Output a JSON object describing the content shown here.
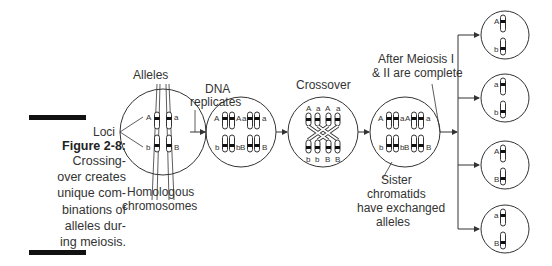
{
  "figure": {
    "title": "Figure 2-8:",
    "caption": "Crossing-\nover creates\nunique com-\nbinations of\nalleles dur-\ning meiosis."
  },
  "labels": {
    "alleles": "Alleles",
    "loci": "Loci",
    "homologous_1": "Homologous",
    "homologous_2": "chromosomes",
    "dna_1": "DNA",
    "dna_2": "replicates",
    "crossover": "Crossover",
    "after_1": "After Meiosis I",
    "after_2": "& II are complete",
    "sister_1": "Sister",
    "sister_2": "chromatids",
    "sister_3": "have exchanged",
    "sister_4": "alleles"
  },
  "stages": [
    {
      "name": "homologous-pair",
      "top_alleles": [
        "A",
        "a"
      ],
      "bottom_alleles": [
        "b",
        "B"
      ]
    },
    {
      "name": "replicated",
      "top_alleles": [
        "A",
        "A",
        "a",
        "a"
      ],
      "bottom_alleles": [
        "b",
        "b",
        "B",
        "B"
      ]
    },
    {
      "name": "crossover",
      "top_alleles": [
        "A",
        "a",
        "A",
        "a"
      ],
      "bottom_alleles": [
        "b",
        "b",
        "B",
        "B"
      ]
    },
    {
      "name": "exchanged",
      "top_alleles": [
        "A",
        "a",
        "A",
        "a"
      ],
      "bottom_alleles": [
        "b",
        "b",
        "B",
        "B"
      ]
    }
  ],
  "gametes": [
    {
      "top": "A",
      "bottom": "b"
    },
    {
      "top": "a",
      "bottom": "b"
    },
    {
      "top": "A",
      "bottom": "B"
    },
    {
      "top": "a",
      "bottom": "B"
    }
  ],
  "colors": {
    "line": "#333333",
    "band": "#111111",
    "text": "#333333"
  }
}
